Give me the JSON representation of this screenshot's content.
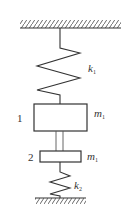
{
  "diagram": {
    "type": "spring-mass system",
    "colors": {
      "line": "#333333",
      "background": "#ffffff"
    },
    "top_support": {
      "label": "fixed ceiling"
    },
    "bottom_support": {
      "label": "fixed ground"
    },
    "springs": [
      {
        "id": "k1",
        "symbol": "k",
        "subscript": "1"
      },
      {
        "id": "k2",
        "symbol": "k",
        "subscript": "2"
      }
    ],
    "masses": [
      {
        "id": "1",
        "number": "1",
        "symbol": "m",
        "subscript": "1"
      },
      {
        "id": "2",
        "number": "2",
        "symbol": "m",
        "subscript": "1"
      }
    ]
  }
}
